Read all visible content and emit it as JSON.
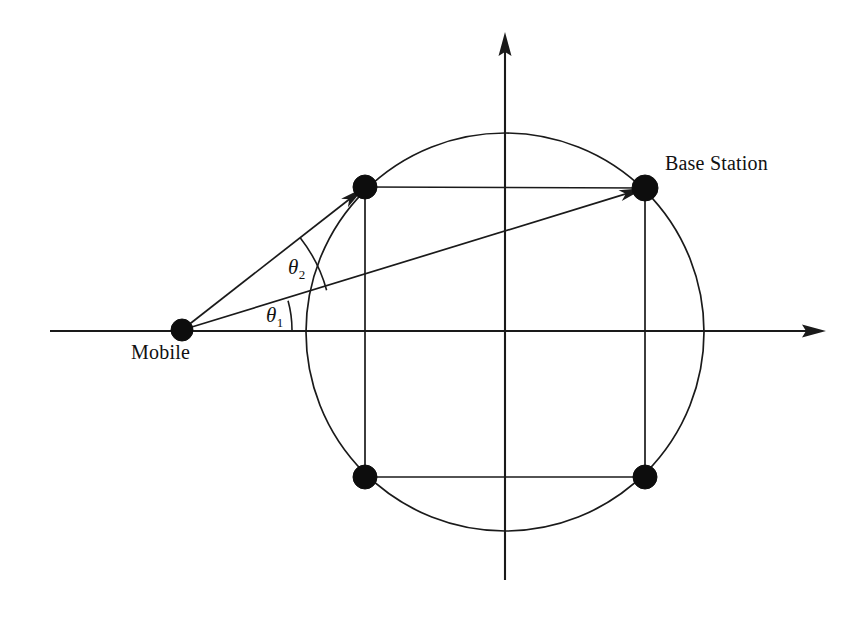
{
  "figure": {
    "background_color": "#ffffff",
    "stroke_color": "#1a1a1a",
    "node_fill_color": "#0d0d0d",
    "width": 856,
    "height": 620
  },
  "labels": {
    "mobile": "Mobile",
    "base_station": "Base Station",
    "theta1_symbol": "θ",
    "theta1_subscript": "1",
    "theta2_symbol": "θ",
    "theta2_subscript": "2"
  },
  "axes": {
    "origin": {
      "x": 505,
      "y": 331
    },
    "horizontal": {
      "x1": 50,
      "y1": 331,
      "x2": 826,
      "y2": 331,
      "arrow": "right"
    },
    "vertical": {
      "x1": 505,
      "y1": 580,
      "x2": 505,
      "y2": 32,
      "arrow": "up"
    }
  },
  "chart_data": {
    "type": "scatter",
    "xlabel": "",
    "ylabel": "",
    "grid": false,
    "legend": "none",
    "scatterer_circle": {
      "cx": 505,
      "cy": 332,
      "r": 199
    },
    "nodes": [
      {
        "name": "mobile",
        "label": "Mobile",
        "x": 182,
        "y": 330,
        "r": 11
      },
      {
        "name": "scatterer-top-left",
        "label": "",
        "x": 365,
        "y": 187,
        "r": 12
      },
      {
        "name": "base-station",
        "label": "Base Station",
        "x": 645,
        "y": 188,
        "r": 13
      },
      {
        "name": "scatterer-bottom-left",
        "label": "",
        "x": 365,
        "y": 477,
        "r": 12
      },
      {
        "name": "scatterer-bottom-right",
        "label": "",
        "x": 645,
        "y": 477,
        "r": 12
      }
    ],
    "rectangle_edges": [
      {
        "from": "scatterer-top-left",
        "to": "base-station"
      },
      {
        "from": "base-station",
        "to": "scatterer-bottom-right"
      },
      {
        "from": "scatterer-bottom-right",
        "to": "scatterer-bottom-left"
      },
      {
        "from": "scatterer-bottom-left",
        "to": "scatterer-top-left"
      }
    ],
    "rays": [
      {
        "name": "ray-to-base-station",
        "from": "mobile",
        "to": "base-station",
        "arrow": true,
        "angle_deg": 15.4
      },
      {
        "name": "ray-to-scatterer-top-left",
        "from": "mobile",
        "to": "scatterer-top-left",
        "arrow": true,
        "angle_deg": 38.0
      }
    ],
    "angles": [
      {
        "name": "theta1",
        "label": "θ₁",
        "vertex": "mobile",
        "from_deg": 0,
        "to_deg": 15.4,
        "arc_radius": 110,
        "between": "horizontal-axis and ray-to-base-station"
      },
      {
        "name": "theta2",
        "label": "θ₂",
        "vertex": "mobile",
        "from_deg": 15.4,
        "to_deg": 38.0,
        "arc_radius": 150,
        "between": "ray-to-base-station and ray-to-scatterer-top-left"
      }
    ]
  }
}
